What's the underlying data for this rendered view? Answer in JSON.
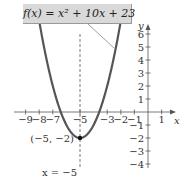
{
  "chart_data": {
    "type": "line",
    "title": "",
    "function_label": "f(x) = x² + 10x + 23",
    "xlabel": "x",
    "ylabel": "y",
    "xlim": [
      -9.5,
      2
    ],
    "ylim": [
      -4.5,
      7
    ],
    "x_ticks": [
      -9,
      -8,
      -7,
      -5,
      -3,
      -2,
      -1,
      1
    ],
    "x_tick_labels": [
      "−9",
      "−8",
      "−7",
      "−5",
      "−3",
      "−2",
      "−1",
      "1"
    ],
    "y_ticks": [
      -4,
      -3,
      -2,
      -1,
      1,
      2,
      3,
      4,
      5,
      6
    ],
    "y_tick_labels": [
      "−4",
      "−3",
      "−2",
      "−1",
      "1",
      "2",
      "3",
      "4",
      "5",
      "6"
    ],
    "series": [
      {
        "name": "f(x) = x² + 10x + 23",
        "x": [
          -9.5,
          -9,
          -8,
          -7,
          -6,
          -5,
          -4,
          -3,
          -2,
          -1.5
        ],
        "y": [
          15.25,
          14,
          7,
          2,
          -1,
          -2,
          -1,
          2,
          7,
          10.25
        ]
      }
    ],
    "vertex": {
      "x": -5,
      "y": -2,
      "label": "(−5, −2)"
    },
    "axis_of_symmetry": {
      "x": -5,
      "label": "x = −5"
    },
    "grid": false
  }
}
